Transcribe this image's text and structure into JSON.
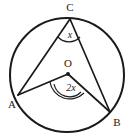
{
  "figure": {
    "kind": "circle-geometry-diagram",
    "background_color": "#ffffff",
    "stroke_color": "#1a1a1a",
    "canvas": {
      "width": 133,
      "height": 139
    }
  },
  "circle": {
    "name": "main-circle",
    "center_x": 67,
    "center_y": 75,
    "radius": 57,
    "stroke_width": 2,
    "fill": "none"
  },
  "points": {
    "C": {
      "label": "C",
      "x": 70,
      "y": 19,
      "label_x": 70,
      "label_y": 11
    },
    "A": {
      "label": "A",
      "x": 18,
      "y": 95,
      "label_x": 12,
      "label_y": 108
    },
    "B": {
      "label": "B",
      "x": 110,
      "y": 112,
      "label_x": 117,
      "label_y": 126
    },
    "O": {
      "label": "O",
      "x": 68,
      "y": 74,
      "label_x": 68,
      "label_y": 67,
      "dot_radius": 2
    }
  },
  "segments": [
    {
      "name": "segment-AC",
      "x1": 18,
      "y1": 95,
      "x2": 70,
      "y2": 19
    },
    {
      "name": "segment-CB",
      "x1": 70,
      "y1": 19,
      "x2": 110,
      "y2": 112
    },
    {
      "name": "segment-AO",
      "x1": 18,
      "y1": 95,
      "x2": 68,
      "y2": 74
    },
    {
      "name": "segment-OB",
      "x1": 68,
      "y1": 74,
      "x2": 110,
      "y2": 112
    }
  ],
  "angles": {
    "at_C": {
      "name": "angle-x-at-C",
      "text": "x",
      "text_x": 70,
      "text_y": 38,
      "arc_path": "M 58 37 A 15 15 0 0 0 80 37",
      "arc_count": 1
    },
    "at_O": {
      "name": "angle-2x-at-O",
      "text": "2x",
      "text_x": 71,
      "text_y": 91,
      "arc_path_outer": "M 50 82 A 20 20 0 0 0 84 93",
      "arc_path_inner": "M 54 84 A 16 16 0 0 0 81 92",
      "arc_count": 2
    }
  }
}
